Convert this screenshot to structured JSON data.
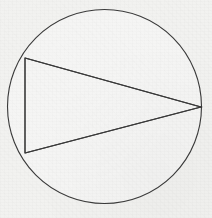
{
  "figure": {
    "kind": "geometry-diagram",
    "canvas": {
      "width": 212,
      "height": 218
    },
    "background_color": "#f2f2f0",
    "interior_color": "#f5f5f4",
    "stroke_color": "#3a3a3a",
    "stroke_width": 1.1,
    "circle": {
      "label": "circumscribed-circle",
      "center_x": 104.5,
      "center_y": 106.5,
      "radius": 97
    },
    "triangle": {
      "label": "inscribed-triangle",
      "vertices": [
        {
          "name": "A",
          "x": 25,
          "y": 58
        },
        {
          "name": "B",
          "x": 25,
          "y": 153
        },
        {
          "name": "C",
          "x": 201,
          "y": 107
        }
      ],
      "sides": [
        {
          "name": "AB",
          "type": "vertical-chord"
        },
        {
          "name": "BC",
          "type": "chord"
        },
        {
          "name": "CA",
          "type": "chord"
        }
      ]
    },
    "labels": [],
    "annotations": []
  }
}
